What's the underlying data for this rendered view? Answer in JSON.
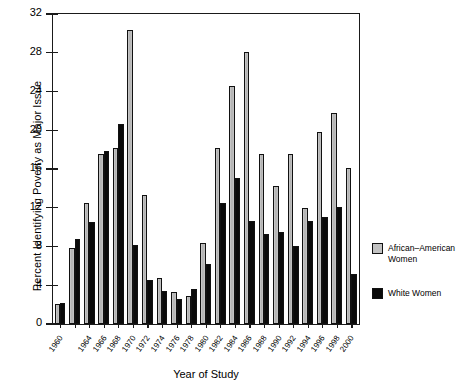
{
  "chart_data": {
    "type": "bar",
    "title": "",
    "xlabel": "Year of Study",
    "ylabel": "Percent Identifying Poverty as Major Issue",
    "ylim": [
      0,
      32
    ],
    "yticks": [
      0,
      4,
      8,
      12,
      16,
      20,
      24,
      28,
      32
    ],
    "grid": false,
    "legend_position": "right",
    "categories": [
      "1960",
      "1962",
      "1964",
      "1966",
      "1968",
      "1970",
      "1972",
      "1974",
      "1976",
      "1978",
      "1980",
      "1982",
      "1984",
      "1986",
      "1988",
      "1990",
      "1992",
      "1994",
      "1996",
      "1998",
      "2000"
    ],
    "tick_labels_shown": [
      "1960",
      "1964",
      "1966",
      "1968",
      "1970",
      "1972",
      "1974",
      "1976",
      "1978",
      "1980",
      "1982",
      "1984",
      "1986",
      "1988",
      "1990",
      "1992",
      "1994",
      "1996",
      "1998",
      "2000"
    ],
    "series": [
      {
        "name": "African-American Women",
        "color": "#b9b9b9",
        "values": [
          2.1,
          7.8,
          12.5,
          17.5,
          18.2,
          30.3,
          13.3,
          4.7,
          3.3,
          2.9,
          8.4,
          18.2,
          24.6,
          28.1,
          17.6,
          14.2,
          17.5,
          12.0,
          19.8,
          21.8,
          16.1
        ]
      },
      {
        "name": "White Women",
        "color": "#0a0a0a",
        "values": [
          2.2,
          8.8,
          10.5,
          17.9,
          20.6,
          8.2,
          4.5,
          3.4,
          2.6,
          3.6,
          6.2,
          12.5,
          15.1,
          10.6,
          9.3,
          9.5,
          8.1,
          10.6,
          11.0,
          12.1,
          5.2
        ]
      }
    ]
  },
  "legend": {
    "items": [
      {
        "label": "African–American\nWomen",
        "swatch": "aa"
      },
      {
        "label": "White Women",
        "swatch": "wh"
      }
    ]
  }
}
